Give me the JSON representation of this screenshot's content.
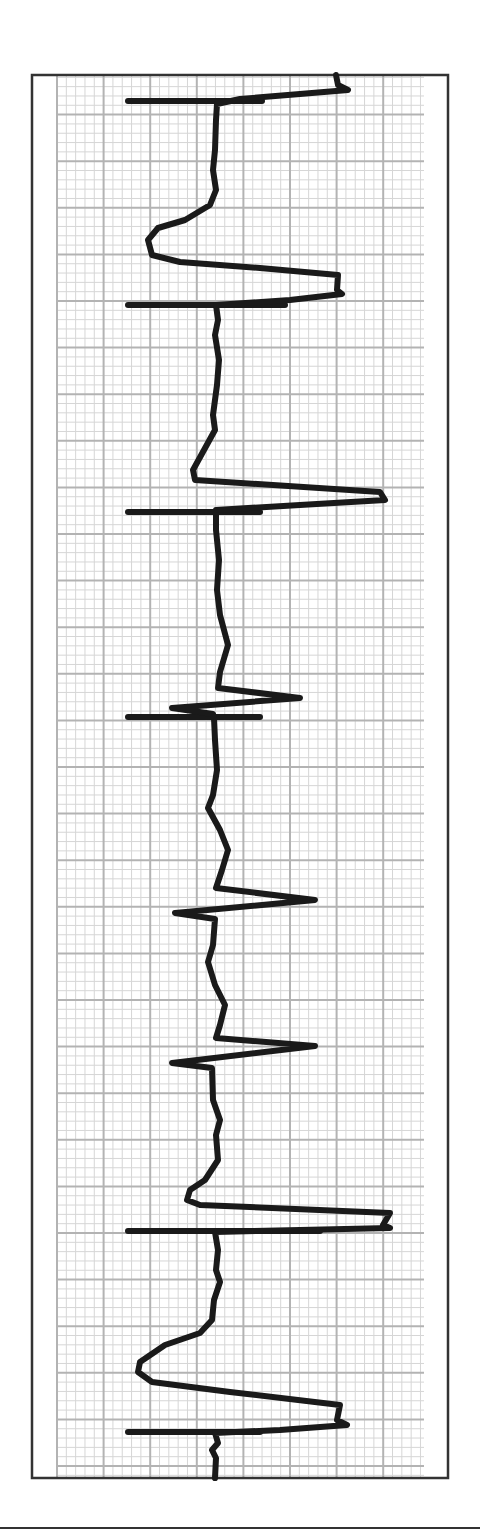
{
  "chart_data": {
    "type": "line",
    "title": "",
    "xlabel": "",
    "ylabel": "",
    "grid": true,
    "orientation": "vertical",
    "colors": {
      "trace": "#1a1a1a",
      "border": "#333333",
      "grid_major": "#b3b3b3",
      "grid_minor": "#d6d6d6",
      "paper": "#ffffff"
    },
    "frame": {
      "x": 32,
      "y": 75,
      "width": 416,
      "height": 1403
    },
    "grid_area": {
      "x": 55,
      "y": 75,
      "width": 369,
      "height": 1403,
      "major_spacing": 46.6,
      "minor_divisions": 5
    },
    "markers": [
      {
        "y": 101,
        "x1": 128,
        "x2": 262
      },
      {
        "y": 305,
        "x1": 128,
        "x2": 285
      },
      {
        "y": 512,
        "x1": 128,
        "x2": 260
      },
      {
        "y": 717,
        "x1": 128,
        "x2": 260
      },
      {
        "y": 1231,
        "x1": 128,
        "x2": 320
      },
      {
        "y": 1432,
        "x1": 128,
        "x2": 260
      }
    ],
    "trace_points": [
      [
        336,
        75
      ],
      [
        338,
        85
      ],
      [
        348,
        90
      ],
      [
        300,
        94
      ],
      [
        240,
        99
      ],
      [
        217,
        104
      ],
      [
        216,
        120
      ],
      [
        215,
        150
      ],
      [
        213,
        170
      ],
      [
        216,
        190
      ],
      [
        210,
        205
      ],
      [
        185,
        220
      ],
      [
        158,
        228
      ],
      [
        148,
        240
      ],
      [
        152,
        255
      ],
      [
        180,
        262
      ],
      [
        260,
        268
      ],
      [
        338,
        275
      ],
      [
        337,
        290
      ],
      [
        342,
        294
      ],
      [
        290,
        300
      ],
      [
        216,
        305
      ],
      [
        218,
        320
      ],
      [
        215,
        335
      ],
      [
        219,
        360
      ],
      [
        217,
        385
      ],
      [
        213,
        415
      ],
      [
        215,
        430
      ],
      [
        193,
        470
      ],
      [
        195,
        480
      ],
      [
        380,
        492
      ],
      [
        385,
        500
      ],
      [
        300,
        505
      ],
      [
        216,
        510
      ],
      [
        216,
        530
      ],
      [
        219,
        560
      ],
      [
        217,
        590
      ],
      [
        220,
        615
      ],
      [
        228,
        645
      ],
      [
        220,
        672
      ],
      [
        218,
        688
      ],
      [
        300,
        698
      ],
      [
        172,
        708
      ],
      [
        213,
        714
      ],
      [
        214,
        718
      ],
      [
        215,
        740
      ],
      [
        217,
        770
      ],
      [
        213,
        795
      ],
      [
        208,
        808
      ],
      [
        220,
        830
      ],
      [
        228,
        850
      ],
      [
        222,
        870
      ],
      [
        216,
        888
      ],
      [
        315,
        900
      ],
      [
        175,
        913
      ],
      [
        215,
        919
      ],
      [
        213,
        945
      ],
      [
        208,
        962
      ],
      [
        215,
        985
      ],
      [
        225,
        1005
      ],
      [
        220,
        1025
      ],
      [
        216,
        1038
      ],
      [
        315,
        1046
      ],
      [
        172,
        1063
      ],
      [
        212,
        1068
      ],
      [
        213,
        1100
      ],
      [
        220,
        1120
      ],
      [
        216,
        1135
      ],
      [
        218,
        1160
      ],
      [
        205,
        1180
      ],
      [
        190,
        1190
      ],
      [
        187,
        1200
      ],
      [
        200,
        1205
      ],
      [
        390,
        1213
      ],
      [
        383,
        1225
      ],
      [
        390,
        1228
      ],
      [
        300,
        1230
      ],
      [
        215,
        1232
      ],
      [
        218,
        1250
      ],
      [
        216,
        1270
      ],
      [
        220,
        1282
      ],
      [
        214,
        1300
      ],
      [
        212,
        1320
      ],
      [
        200,
        1333
      ],
      [
        165,
        1345
      ],
      [
        140,
        1362
      ],
      [
        138,
        1372
      ],
      [
        152,
        1382
      ],
      [
        230,
        1392
      ],
      [
        340,
        1405
      ],
      [
        337,
        1420
      ],
      [
        347,
        1425
      ],
      [
        280,
        1430
      ],
      [
        215,
        1433
      ],
      [
        218,
        1443
      ],
      [
        212,
        1450
      ],
      [
        216,
        1458
      ],
      [
        215,
        1478
      ]
    ]
  }
}
